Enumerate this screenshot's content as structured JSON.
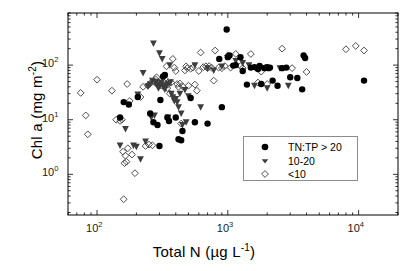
{
  "chart_data": {
    "type": "scatter",
    "title": "",
    "xlabel": "Total N (µg L⁻¹)",
    "ylabel": "Chl a (mg m⁻²)",
    "xscale": "log",
    "yscale": "log",
    "xlim": [
      60,
      20000
    ],
    "ylim": [
      0.18,
      900
    ],
    "grid": false,
    "xticks": [
      100,
      1000,
      10000
    ],
    "xticklabels": [
      "10²",
      "10³",
      "10⁴"
    ],
    "yticks": [
      1,
      10,
      100
    ],
    "yticklabels": [
      "10⁰",
      "10¹",
      "10²"
    ],
    "legend_position": "lower right",
    "series": [
      {
        "name": "TN:TP > 20",
        "marker": "filled-circle",
        "color": "#000000",
        "points": [
          [
            150,
            11
          ],
          [
            160,
            21
          ],
          [
            175,
            19
          ],
          [
            205,
            26
          ],
          [
            255,
            13
          ],
          [
            270,
            9
          ],
          [
            290,
            8
          ],
          [
            300,
            3.3
          ],
          [
            305,
            23
          ],
          [
            320,
            62
          ],
          [
            330,
            66
          ],
          [
            345,
            11
          ],
          [
            355,
            9.5
          ],
          [
            400,
            11
          ],
          [
            420,
            4.4
          ],
          [
            440,
            4.2
          ],
          [
            450,
            6.2
          ],
          [
            520,
            25
          ],
          [
            560,
            9
          ],
          [
            700,
            8.5
          ],
          [
            860,
            130
          ],
          [
            900,
            17
          ],
          [
            980,
            450
          ],
          [
            1000,
            140
          ],
          [
            1030,
            150
          ],
          [
            1100,
            98
          ],
          [
            1150,
            100
          ],
          [
            1250,
            140
          ],
          [
            1300,
            78
          ],
          [
            1400,
            44
          ],
          [
            1500,
            90
          ],
          [
            1600,
            92
          ],
          [
            1700,
            85
          ],
          [
            1750,
            97
          ],
          [
            1800,
            45
          ],
          [
            1900,
            88
          ],
          [
            1950,
            90
          ],
          [
            2000,
            92
          ],
          [
            2050,
            88
          ],
          [
            2100,
            90
          ],
          [
            2200,
            52
          ],
          [
            2400,
            42
          ],
          [
            2600,
            88
          ],
          [
            2800,
            90
          ],
          [
            3000,
            60
          ],
          [
            3400,
            58
          ],
          [
            3700,
            36
          ],
          [
            3800,
            150
          ],
          [
            3900,
            135
          ],
          [
            11000,
            52
          ]
        ]
      },
      {
        "name": "10-20",
        "marker": "filled-triangle-down",
        "color": "#3d3d3d",
        "points": [
          [
            150,
            3.4
          ],
          [
            165,
            6.8
          ],
          [
            190,
            3.4
          ],
          [
            200,
            3.2
          ],
          [
            205,
            29
          ],
          [
            215,
            1.9
          ],
          [
            225,
            72
          ],
          [
            235,
            4.0
          ],
          [
            245,
            41
          ],
          [
            255,
            45
          ],
          [
            260,
            11
          ],
          [
            265,
            52
          ],
          [
            270,
            250
          ],
          [
            275,
            12
          ],
          [
            280,
            47
          ],
          [
            285,
            50
          ],
          [
            290,
            43
          ],
          [
            295,
            38
          ],
          [
            300,
            165
          ],
          [
            305,
            44
          ],
          [
            310,
            48
          ],
          [
            315,
            130
          ],
          [
            320,
            40
          ],
          [
            325,
            42
          ],
          [
            330,
            36
          ],
          [
            340,
            43
          ],
          [
            350,
            11
          ],
          [
            355,
            46
          ],
          [
            360,
            100
          ],
          [
            365,
            49
          ],
          [
            370,
            30
          ],
          [
            380,
            26
          ],
          [
            390,
            22
          ],
          [
            400,
            24
          ],
          [
            410,
            21
          ],
          [
            420,
            17
          ],
          [
            430,
            30
          ],
          [
            440,
            13
          ],
          [
            450,
            8
          ],
          [
            470,
            35
          ],
          [
            480,
            9
          ],
          [
            500,
            27
          ],
          [
            560,
            100
          ],
          [
            620,
            17
          ],
          [
            700,
            88
          ],
          [
            780,
            80
          ],
          [
            900,
            95
          ],
          [
            1150,
            120
          ],
          [
            1300,
            110
          ],
          [
            1450,
            100
          ],
          [
            1600,
            42
          ],
          [
            2000,
            38
          ],
          [
            2500,
            88
          ],
          [
            2900,
            42
          ]
        ]
      },
      {
        "name": "<10",
        "marker": "open-diamond",
        "color": "#4d4d4d",
        "points": [
          [
            75,
            31
          ],
          [
            82,
            12
          ],
          [
            85,
            5.4
          ],
          [
            100,
            54
          ],
          [
            130,
            34
          ],
          [
            140,
            10
          ],
          [
            150,
            9.5
          ],
          [
            155,
            10
          ],
          [
            158,
            2.6
          ],
          [
            160,
            0.35
          ],
          [
            162,
            1.6
          ],
          [
            165,
            2.2
          ],
          [
            168,
            1.7
          ],
          [
            170,
            45
          ],
          [
            172,
            3.0
          ],
          [
            178,
            22
          ],
          [
            185,
            2.3
          ],
          [
            195,
            1.05
          ],
          [
            215,
            26
          ],
          [
            225,
            40
          ],
          [
            235,
            3.3
          ],
          [
            245,
            42
          ],
          [
            250,
            3.5
          ],
          [
            255,
            46
          ],
          [
            265,
            3.4
          ],
          [
            275,
            49
          ],
          [
            280,
            55
          ],
          [
            285,
            60
          ],
          [
            290,
            44
          ],
          [
            300,
            47
          ],
          [
            310,
            42
          ],
          [
            320,
            50
          ],
          [
            330,
            56
          ],
          [
            340,
            95
          ],
          [
            345,
            38
          ],
          [
            350,
            44
          ],
          [
            360,
            30
          ],
          [
            370,
            48
          ],
          [
            380,
            130
          ],
          [
            390,
            90
          ],
          [
            400,
            78
          ],
          [
            410,
            45
          ],
          [
            420,
            40
          ],
          [
            430,
            46
          ],
          [
            440,
            8.5
          ],
          [
            450,
            41
          ],
          [
            470,
            80
          ],
          [
            480,
            95
          ],
          [
            490,
            88
          ],
          [
            500,
            42
          ],
          [
            520,
            86
          ],
          [
            540,
            90
          ],
          [
            560,
            44
          ],
          [
            580,
            34
          ],
          [
            600,
            78
          ],
          [
            620,
            170
          ],
          [
            650,
            92
          ],
          [
            680,
            95
          ],
          [
            700,
            88
          ],
          [
            720,
            96
          ],
          [
            750,
            90
          ],
          [
            780,
            52
          ],
          [
            800,
            185
          ],
          [
            850,
            90
          ],
          [
            900,
            88
          ],
          [
            950,
            96
          ],
          [
            1000,
            150
          ],
          [
            1050,
            90
          ],
          [
            1150,
            160
          ],
          [
            1250,
            96
          ],
          [
            1300,
            88
          ],
          [
            1500,
            160
          ],
          [
            1700,
            48
          ],
          [
            1800,
            76
          ],
          [
            2000,
            45
          ],
          [
            2600,
            200
          ],
          [
            3100,
            88
          ],
          [
            4000,
            75
          ],
          [
            8000,
            195
          ],
          [
            9500,
            225
          ],
          [
            11000,
            185
          ]
        ]
      }
    ]
  },
  "legend": {
    "entries": [
      {
        "label": "TN:TP > 20",
        "marker": "filled-circle"
      },
      {
        "label": "10-20",
        "marker": "filled-triangle-down"
      },
      {
        "label": "<10",
        "marker": "open-diamond"
      }
    ]
  },
  "axes": {
    "x": {
      "label_main": "Total N (µg L",
      "label_sup": "-1",
      "label_tail": ")",
      "tick_labels": [
        {
          "base": "10",
          "exp": "2"
        },
        {
          "base": "10",
          "exp": "3"
        },
        {
          "base": "10",
          "exp": "4"
        }
      ]
    },
    "y": {
      "label_main": "Chl a (mg m",
      "label_sup": "-2",
      "label_tail": ")",
      "tick_labels": [
        {
          "base": "10",
          "exp": "2"
        },
        {
          "base": "10",
          "exp": "1"
        },
        {
          "base": "10",
          "exp": "0"
        }
      ]
    }
  },
  "style": {
    "frame_color": "#000000",
    "background": "#ffffff"
  }
}
